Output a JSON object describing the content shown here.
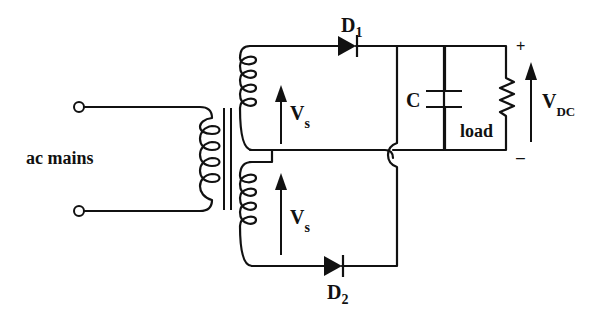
{
  "diagram": {
    "labels": {
      "ac_mains": "ac mains",
      "d1_main": "D",
      "d1_sub": "1",
      "d2_main": "D",
      "d2_sub": "2",
      "vs_top_main": "V",
      "vs_top_sub": "s",
      "vs_bottom_main": "V",
      "vs_bottom_sub": "s",
      "capacitor": "C",
      "load": "load",
      "vdc_main": "V",
      "vdc_sub": "DC",
      "plus": "+",
      "minus": "–"
    },
    "components": [
      {
        "type": "ac-terminal",
        "name": "input terminal top"
      },
      {
        "type": "ac-terminal",
        "name": "input terminal bottom"
      },
      {
        "type": "transformer",
        "name": "center-tapped transformer",
        "primary_turns": 4,
        "secondary_turns_each_half": 4
      },
      {
        "type": "diode",
        "name": "D1"
      },
      {
        "type": "diode",
        "name": "D2"
      },
      {
        "type": "capacitor",
        "name": "C"
      },
      {
        "type": "resistor",
        "name": "load"
      }
    ]
  }
}
